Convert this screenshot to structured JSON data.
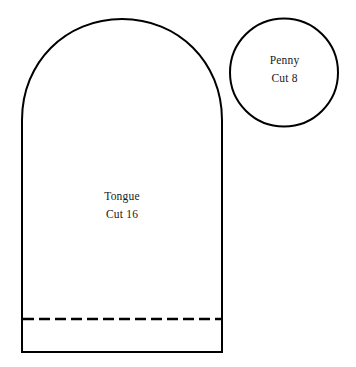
{
  "document": {
    "title": "Tongue and Penny Applique Pattern Template",
    "background_color": "#ffffff",
    "ink_color": "#000000",
    "text_color": "#1a1a1a",
    "width": 356,
    "height": 367
  },
  "shapes": {
    "tongue": {
      "name": "Tongue",
      "label_line1": "Tongue",
      "label_line2": "Cut 16",
      "quantity": 16,
      "outline_color": "#000000",
      "fill_color": "#ffffff",
      "stroke_width": 2,
      "left": 22,
      "right": 222,
      "top": 19,
      "bottom": 352,
      "width": 200,
      "height": 333,
      "arch_height": 101,
      "fold_line": {
        "name": "dashed-fold-line",
        "y": 319,
        "style": "dashed",
        "dash_length": 11,
        "gap_length": 5,
        "color": "#000000",
        "stroke_width": 2
      }
    },
    "penny": {
      "name": "Penny",
      "label_line1": "Penny",
      "label_line2": "Cut 8",
      "quantity": 8,
      "outline_color": "#000000",
      "fill_color": "#ffffff",
      "stroke_width": 2,
      "center_x": 284,
      "center_y": 72.5,
      "radius": 54,
      "diameter": 108,
      "left": 230,
      "right": 338,
      "top": 18,
      "bottom": 127
    }
  }
}
